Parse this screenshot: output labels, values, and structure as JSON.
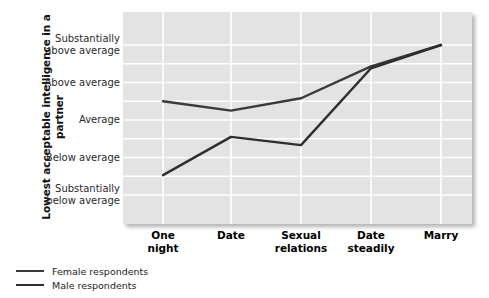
{
  "chart_data": {
    "type": "line",
    "title": "",
    "xlabel": "",
    "ylabel": "Lowest acceptable intelligence in a partner",
    "categories": [
      "One night",
      "Date",
      "Sexual relations",
      "Date steadily",
      "Marry"
    ],
    "category_lines": [
      [
        "One",
        "night"
      ],
      [
        "Date",
        ""
      ],
      [
        "Sexual",
        "relations"
      ],
      [
        "Date",
        "steadily"
      ],
      [
        "Marry",
        ""
      ]
    ],
    "ytick_labels": [
      "Substantially above average",
      "Above average",
      "Average",
      "Below average",
      "Substantially below average"
    ],
    "ytick_lines": [
      [
        "Substantially",
        "above average"
      ],
      [
        "Above average",
        ""
      ],
      [
        "Average",
        ""
      ],
      [
        "Below average",
        ""
      ],
      [
        "Substantially",
        "below average"
      ]
    ],
    "ylim": [
      1,
      5
    ],
    "yticks": [
      5,
      4,
      3,
      2,
      1
    ],
    "grid": true,
    "legend_position": "below-left",
    "series": [
      {
        "name": "Female respondents",
        "values": [
          3.5,
          3.25,
          3.58,
          4.43,
          5.0
        ],
        "color": "#3a3a3a"
      },
      {
        "name": "Male respondents",
        "values": [
          1.53,
          2.55,
          2.33,
          4.38,
          5.0
        ],
        "color": "#2e2e2e"
      }
    ]
  },
  "axis": {
    "y_title": "Lowest acceptable intelligence in a partner"
  },
  "legend": {
    "items": [
      {
        "label": "Female respondents",
        "color": "#3a3a3a"
      },
      {
        "label": "Male respondents",
        "color": "#2e2e2e"
      }
    ]
  },
  "colors": {
    "plot_background": "#e3e3e3",
    "gridline": "#ffffff",
    "line": "#3a3a3a",
    "text": "#1c1c1c"
  }
}
